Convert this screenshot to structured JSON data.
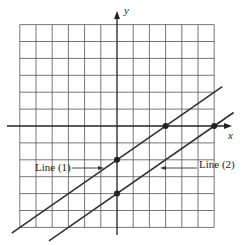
{
  "chart_data": {
    "type": "line",
    "title": "",
    "xlabel": "x",
    "ylabel": "y",
    "xlim": [
      -6,
      6
    ],
    "ylim": [
      -6,
      6
    ],
    "grid": true,
    "series": [
      {
        "name": "Line (1)",
        "slope": 0.6667,
        "intercept": -2,
        "points": [
          [
            0,
            -2
          ],
          [
            3,
            0
          ]
        ]
      },
      {
        "name": "Line (2)",
        "slope": 0.6667,
        "intercept": -4,
        "points": [
          [
            0,
            -4
          ],
          [
            6,
            0
          ]
        ]
      }
    ],
    "annotations": [
      "Line (1)",
      "Line (2)"
    ]
  },
  "labels": {
    "x_axis": "x",
    "y_axis": "y",
    "line1": "Line (1)",
    "line2": "Line (2)"
  },
  "colors": {
    "grid": "#555555",
    "axes": "#222222",
    "lines": "#333333"
  }
}
